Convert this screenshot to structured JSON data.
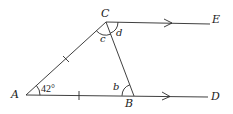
{
  "diagram": {
    "points": {
      "A": {
        "label": "A",
        "x": 26,
        "y": 95
      },
      "B": {
        "label": "B",
        "x": 134,
        "y": 96
      },
      "C": {
        "label": "C",
        "x": 106,
        "y": 22
      },
      "D": {
        "label": "D",
        "x": 208,
        "y": 97
      },
      "E": {
        "label": "E",
        "x": 210,
        "y": 24
      }
    },
    "angles": {
      "A": "42°",
      "b": "b",
      "c": "c",
      "d": "d"
    },
    "notes": {
      "parallel": "CE ∥ AD (arrow marks)",
      "equal_sides": "AC = AB (tick marks)"
    }
  }
}
